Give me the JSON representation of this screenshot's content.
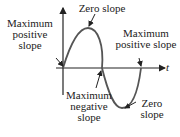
{
  "diagram": {
    "axis_label": "t",
    "curve": "sine wave",
    "labels": {
      "max_positive_left": [
        "Maximum",
        "positive",
        "slope"
      ],
      "zero_top": [
        "Zero slope"
      ],
      "max_positive_right": [
        "Maximum",
        "positive slope"
      ],
      "max_negative": [
        "Maximum",
        "negative",
        "slope"
      ],
      "zero_bottom": [
        "Zero",
        "slope"
      ]
    },
    "colors": {
      "curve": "#555555",
      "axis": "#222222",
      "text": "#222222"
    }
  }
}
